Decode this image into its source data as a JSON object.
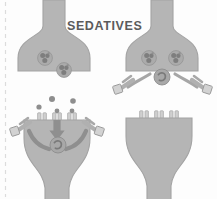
{
  "figure": {
    "title": "SEDATIVES",
    "width": 217,
    "height": 199,
    "background_color": "#fdfdfd",
    "edge_guide_color": "#d9d9d9"
  },
  "palette": {
    "terminal_fill": "#b5b5b5",
    "terminal_stroke": "#a0a0a0",
    "vesicle_fill": "#9a9a9a",
    "vesicle_stroke": "#7d7d7d",
    "molecule_fill": "#8e8e8e",
    "arrow_fill": "#8a8a8a",
    "receptor_fill": "#c9c9c9",
    "receptor_stroke": "#9e9e9e",
    "channel_fill": "#cfcfcf",
    "channel_stroke": "#a5a5a5",
    "title_color": "#5b5b5b"
  },
  "panels": [
    {
      "id": "panel-top-left",
      "position": "top-left",
      "label": "Presynaptic terminal with sedative molecules bound inside",
      "cell_shape": "presynaptic-bouton",
      "vesicles": [
        {
          "cx": 45,
          "cy": 58,
          "r": 7.5,
          "label": "sedative-molecule-cluster"
        },
        {
          "cx": 64,
          "cy": 70,
          "r": 7.5,
          "label": "sedative-molecule-cluster"
        }
      ],
      "has_central_receptor": false,
      "has_side_receptors": false,
      "has_arrows": false,
      "free_molecules": [],
      "membrane_channels": []
    },
    {
      "id": "panel-top-right",
      "position": "top-right",
      "label": "Presynaptic terminal with central receptor and lateral bound receptors",
      "cell_shape": "presynaptic-bouton",
      "vesicles": [
        {
          "cx": 149,
          "cy": 58,
          "r": 7.5,
          "label": "sedative-molecule-cluster"
        },
        {
          "cx": 176,
          "cy": 58,
          "r": 7.5,
          "label": "sedative-molecule-cluster"
        }
      ],
      "has_central_receptor": true,
      "central_receptor": {
        "cx": 162,
        "cy": 77,
        "r": 8
      },
      "has_side_receptors": true,
      "side_receptors": [
        {
          "x": 116,
          "y": 86,
          "label": "left-bound-receptor"
        },
        {
          "x": 199,
          "y": 86,
          "label": "right-bound-receptor"
        }
      ],
      "has_arrows": false,
      "free_molecules": [],
      "membrane_channels": []
    },
    {
      "id": "panel-bottom-left",
      "position": "bottom-left",
      "label": "Postsynaptic cell receiving neurotransmitter with inward signalling arrows",
      "cell_shape": "postsynaptic-cell",
      "vesicles": [],
      "has_central_receptor": true,
      "central_receptor": {
        "cx": 58,
        "cy": 145,
        "r": 8
      },
      "has_side_receptors": true,
      "side_receptors": [
        {
          "x": 17,
          "y": 116,
          "label": "left-bound-receptor"
        },
        {
          "x": 94,
          "y": 116,
          "label": "right-bound-receptor"
        }
      ],
      "has_arrows": true,
      "arrows": [
        {
          "type": "down-arrow",
          "label": "signal-down-arrow"
        },
        {
          "type": "curved-left",
          "label": "signal-curve-left-arrow"
        },
        {
          "type": "curved-right",
          "label": "signal-curve-right-arrow"
        }
      ],
      "free_molecules": [
        {
          "cx": 39,
          "cy": 107,
          "r": 2.6
        },
        {
          "cx": 52,
          "cy": 99,
          "r": 3.0
        },
        {
          "cx": 73,
          "cy": 101,
          "r": 2.8
        },
        {
          "cx": 57,
          "cy": 111,
          "r": 2.4
        },
        {
          "cx": 72,
          "cy": 111,
          "r": 2.4
        }
      ],
      "membrane_channels": [
        {
          "cx": 42,
          "cy": 118,
          "label": "membrane-channel"
        },
        {
          "cx": 57,
          "cy": 118,
          "label": "membrane-channel"
        },
        {
          "cx": 72,
          "cy": 118,
          "label": "membrane-channel"
        }
      ]
    },
    {
      "id": "panel-bottom-right",
      "position": "bottom-right",
      "label": "Resting postsynaptic cell with unoccupied membrane channels",
      "cell_shape": "postsynaptic-cell",
      "vesicles": [],
      "has_central_receptor": false,
      "has_side_receptors": false,
      "has_arrows": false,
      "free_molecules": [],
      "membrane_channels": [
        {
          "cx": 144,
          "cy": 116,
          "label": "membrane-channel"
        },
        {
          "cx": 159,
          "cy": 116,
          "label": "membrane-channel"
        },
        {
          "cx": 174,
          "cy": 116,
          "label": "membrane-channel"
        }
      ]
    }
  ]
}
